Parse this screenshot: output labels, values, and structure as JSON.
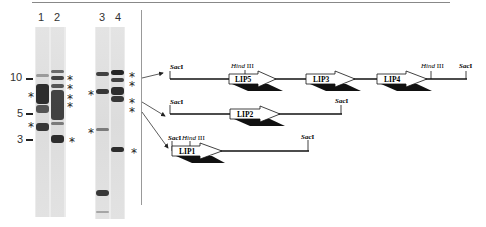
{
  "figure": {
    "lanes": [
      {
        "label": "1"
      },
      {
        "label": "2"
      },
      {
        "label": "3"
      },
      {
        "label": "4"
      }
    ],
    "size_markers": [
      {
        "label": "10"
      },
      {
        "label": "5"
      },
      {
        "label": "3"
      }
    ],
    "asterisk": "*",
    "maps": [
      {
        "name": "map-top",
        "sites": [
          "SacI",
          "Hind III",
          "Hind III",
          "SacI"
        ],
        "genes": [
          "LIP5",
          "LIP3",
          "LIP4"
        ]
      },
      {
        "name": "map-middle",
        "sites": [
          "SacI",
          "SacI"
        ],
        "genes": [
          "LIP2"
        ]
      },
      {
        "name": "map-bottom",
        "sites": [
          "SacI",
          "Hind III",
          "SacI"
        ],
        "genes": [
          "LIP1"
        ]
      }
    ]
  }
}
